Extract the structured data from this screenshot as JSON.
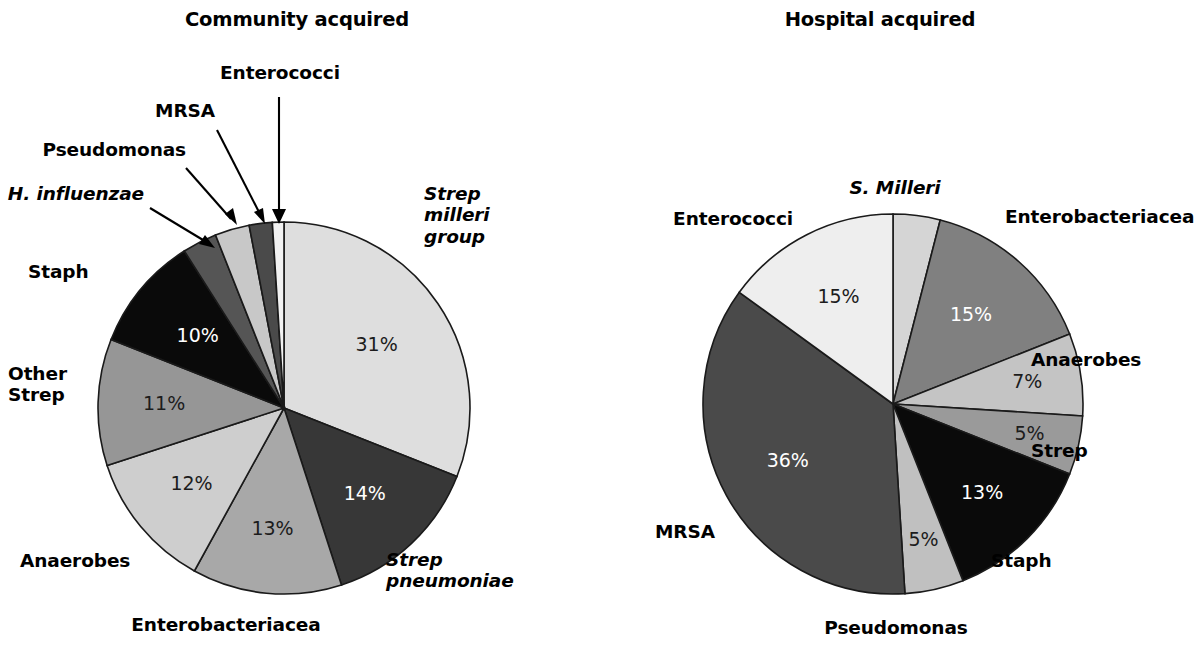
{
  "figure": {
    "background": "#ffffff",
    "label_color": "#000000"
  },
  "chart_data": [
    {
      "type": "pie",
      "title": "Community acquired",
      "labels": [
        "Strep\nmilleri\ngroup",
        "Strep\npneumoniae",
        "Enterobacteriacea",
        "Anaerobes",
        "Other\nStrep",
        "Staph",
        "H. influenzae",
        "Pseudomonas",
        "MRSA",
        "Enterococci"
      ],
      "values": [
        31,
        14,
        13,
        12,
        11,
        10,
        3,
        3,
        2,
        1
      ],
      "value_labels": [
        "31%",
        "14%",
        "13%",
        "12%",
        "11%",
        "10%",
        "",
        "",
        "",
        ""
      ],
      "colors": [
        "#dedede",
        "#373737",
        "#a8a8a8",
        "#cecece",
        "#969696",
        "#0a0a0a",
        "#555555",
        "#c8c8c8",
        "#4a4a4a",
        "#f2f2f2"
      ],
      "start_angle": 0,
      "direction": "clockwise",
      "legend": "callout-labels",
      "grid": false
    },
    {
      "type": "pie",
      "title": "Hospital acquired",
      "labels": [
        "S. Milleri",
        "Enterobacteriacea",
        "Anaerobes",
        "Strep",
        "Staph",
        "Pseudomonas",
        "MRSA",
        "Enterococci"
      ],
      "values": [
        4,
        15,
        7,
        5,
        13,
        5,
        36,
        15
      ],
      "value_labels": [
        "",
        "15%",
        "7%",
        "5%",
        "13%",
        "5%",
        "36%",
        "15%"
      ],
      "colors": [
        "#d5d5d5",
        "#808080",
        "#c4c4c4",
        "#9a9a9a",
        "#0a0a0a",
        "#c0c0c0",
        "#4a4a4a",
        "#eeeeee"
      ],
      "start_angle": 0,
      "direction": "clockwise",
      "legend": "outside-labels",
      "grid": false
    }
  ],
  "community": {
    "title": "Community acquired",
    "labels": {
      "strep_milleri": "Strep\nmilleri\ngroup",
      "strep_pneumoniae": "Strep\npneumoniae",
      "enterobacteriacea": "Enterobacteriacea",
      "anaerobes": "Anaerobes",
      "other_strep": "Other\nStrep",
      "staph": "Staph",
      "h_influenzae": "H. influenzae",
      "pseudomonas": "Pseudomonas",
      "mrsa": "MRSA",
      "enterococci": "Enterococci"
    },
    "percents": {
      "strep_milleri": "31%",
      "strep_pneumoniae": "14%",
      "enterobacteriacea": "13%",
      "anaerobes": "12%",
      "other_strep": "11%",
      "staph": "10%"
    }
  },
  "hospital": {
    "title": "Hospital acquired",
    "labels": {
      "s_milleri": "S. Milleri",
      "enterobacteriacea": "Enterobacteriacea",
      "anaerobes": "Anaerobes",
      "strep": "Strep",
      "staph": "Staph",
      "pseudomonas": "Pseudomonas",
      "mrsa": "MRSA",
      "enterococci": "Enterococci"
    },
    "percents": {
      "enterobacteriacea": "15%",
      "anaerobes": "7%",
      "strep": "5%",
      "staph": "13%",
      "pseudomonas": "5%",
      "mrsa": "36%",
      "enterococci": "15%"
    }
  }
}
